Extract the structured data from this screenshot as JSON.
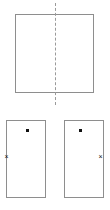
{
  "figure": {
    "width": 110,
    "height": 210,
    "background_color": "#ffffff",
    "stroke_color": "#8e8e8e",
    "dash_color": "#9a9a9a",
    "marker_color": "#111111"
  },
  "shapes": {
    "large_rectangle": {
      "label": "",
      "x": 15,
      "y": 14,
      "width": 79,
      "height": 79,
      "stroke": "#8e8e8e",
      "fill": "#ffffff"
    },
    "symmetry_axis": {
      "label": "",
      "orientation": "vertical",
      "x": 55,
      "y_start": 3,
      "y_end": 105,
      "style": "dashed",
      "color": "#9a9a9a"
    },
    "small_rectangles": [
      {
        "name": "left-half",
        "label": "",
        "x": 6,
        "y": 120,
        "width": 40,
        "height": 78,
        "stroke": "#8e8e8e",
        "fill": "#ffffff",
        "dot": {
          "x": 26,
          "y": 129,
          "glyph": "square-dot"
        },
        "cross": {
          "x": 3,
          "y": 153,
          "glyph": "×",
          "edge": "left"
        }
      },
      {
        "name": "right-half",
        "label": "",
        "x": 64,
        "y": 120,
        "width": 40,
        "height": 78,
        "stroke": "#8e8e8e",
        "fill": "#ffffff",
        "dot": {
          "x": 79,
          "y": 129,
          "glyph": "square-dot"
        },
        "cross": {
          "x": 97,
          "y": 153,
          "glyph": "×",
          "edge": "right"
        }
      }
    ]
  },
  "markers": {
    "cross_glyph": "×",
    "dot_glyph": ""
  }
}
